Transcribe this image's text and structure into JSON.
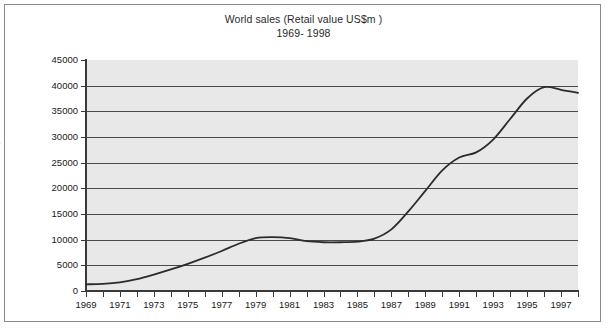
{
  "chart_data": {
    "type": "line",
    "title": "World sales (Retail value US$m )",
    "subtitle": "1969- 1998",
    "xlabel": "",
    "ylabel": "US$m",
    "xlim": [
      1969,
      1998
    ],
    "ylim": [
      0,
      45000
    ],
    "grid": true,
    "legend": "none",
    "y_ticks": [
      0,
      5000,
      10000,
      15000,
      20000,
      25000,
      30000,
      35000,
      40000,
      45000
    ],
    "y_tick_labels": [
      "0",
      "5000",
      "10000",
      "15000",
      "20000",
      "25000",
      "30000",
      "35000",
      "40000",
      "45000"
    ],
    "x_ticks": [
      1969,
      1970,
      1971,
      1972,
      1973,
      1974,
      1975,
      1976,
      1977,
      1978,
      1979,
      1980,
      1981,
      1982,
      1983,
      1984,
      1985,
      1986,
      1987,
      1988,
      1989,
      1990,
      1991,
      1992,
      1993,
      1994,
      1995,
      1996,
      1997,
      1998
    ],
    "x_tick_labels": [
      "1969",
      "1971",
      "1973",
      "1975",
      "1977",
      "1979",
      "1981",
      "1983",
      "1985",
      "1987",
      "1989",
      "1991",
      "1993",
      "1995",
      "1997"
    ],
    "x_tick_label_years": [
      1969,
      1971,
      1973,
      1975,
      1977,
      1979,
      1981,
      1983,
      1985,
      1987,
      1989,
      1991,
      1993,
      1995,
      1997
    ],
    "series": [
      {
        "name": "World sales",
        "color": "#2b2b2b",
        "x": [
          1969,
          1970,
          1971,
          1972,
          1973,
          1974,
          1975,
          1976,
          1977,
          1978,
          1979,
          1980,
          1981,
          1982,
          1983,
          1984,
          1985,
          1986,
          1987,
          1988,
          1989,
          1990,
          1991,
          1992,
          1993,
          1994,
          1995,
          1996,
          1997,
          1998
        ],
        "values": [
          1300,
          1400,
          1700,
          2300,
          3200,
          4200,
          5300,
          6500,
          7800,
          9200,
          10300,
          10500,
          10300,
          9700,
          9500,
          9500,
          9600,
          10200,
          12000,
          15500,
          19500,
          23500,
          26000,
          27000,
          29500,
          33500,
          37500,
          39700,
          39200,
          38600
        ]
      }
    ],
    "colors": {
      "plot_background": "#e8e8e8",
      "gridline": "#4a4a4a",
      "axis": "#3a3a3a",
      "line": "#2b2b2b",
      "frame": "#8a8a8a",
      "text": "#202020"
    }
  }
}
